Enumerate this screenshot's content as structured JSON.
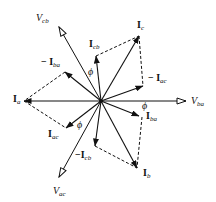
{
  "diagram": {
    "type": "phasor-diagram",
    "origin": [
      101,
      101
    ],
    "voltages": [
      {
        "id": "Vba",
        "label": "V",
        "sub": "ba",
        "tip": [
          186,
          101
        ]
      },
      {
        "id": "Vcb",
        "label": "V",
        "sub": "cb",
        "tip": [
          59,
          27
        ]
      },
      {
        "id": "Vac",
        "label": "V",
        "sub": "ac",
        "tip": [
          59,
          177
        ]
      }
    ],
    "currents": [
      {
        "id": "Ia",
        "label": "I",
        "sub": "a",
        "tip": [
          24,
          101
        ]
      },
      {
        "id": "Ib",
        "label": "I",
        "sub": "b",
        "tip": [
          137,
          168
        ]
      },
      {
        "id": "Ic",
        "label": "I",
        "sub": "c",
        "tip": [
          139,
          36
        ]
      },
      {
        "id": "Iba",
        "label": "I",
        "sub": "ba",
        "tip": [
          139,
          116
        ]
      },
      {
        "id": "Icb",
        "label": "I",
        "sub": "cb",
        "tip": [
          96,
          56
        ]
      },
      {
        "id": "Iac",
        "label": "I",
        "sub": "ac",
        "tip": [
          66,
          128
        ]
      },
      {
        "id": "negIba",
        "label": "− I",
        "sub": "ba",
        "tip": [
          65,
          72
        ]
      },
      {
        "id": "negIcb",
        "label": "−I",
        "sub": "cb",
        "tip": [
          95,
          146
        ]
      },
      {
        "id": "negIac",
        "label": "− I",
        "sub": "ac",
        "tip": [
          143,
          86
        ]
      }
    ],
    "dashed": [
      [
        [
          65,
          72
        ],
        [
          24,
          101
        ]
      ],
      [
        [
          24,
          101
        ],
        [
          66,
          128
        ]
      ],
      [
        [
          96,
          56
        ],
        [
          139,
          36
        ]
      ],
      [
        [
          139,
          36
        ],
        [
          143,
          86
        ]
      ],
      [
        [
          142,
          117
        ],
        [
          137,
          168
        ]
      ],
      [
        [
          95,
          146
        ],
        [
          137,
          168
        ]
      ]
    ],
    "angle_symbol": "ϕ"
  },
  "labels": {
    "Vcb": {
      "main": "V",
      "sub": "cb"
    },
    "Vba": {
      "main": "V",
      "sub": "ba"
    },
    "Vac": {
      "main": "V",
      "sub": "ac"
    },
    "Ic": {
      "main": "I",
      "sub": "c"
    },
    "Icb": {
      "main": "I",
      "sub": "cb"
    },
    "negIba": {
      "main": "− I",
      "sub": "ba"
    },
    "negIac": {
      "main": "− I",
      "sub": "ac"
    },
    "Ia": {
      "main": "I",
      "sub": "a"
    },
    "Iac": {
      "main": "I",
      "sub": "ac"
    },
    "Iba": {
      "main": "I",
      "sub": "ba"
    },
    "negIcb": {
      "main": "−I",
      "sub": "cb"
    },
    "Ib": {
      "main": "I",
      "sub": "b"
    },
    "phi": "ϕ"
  }
}
